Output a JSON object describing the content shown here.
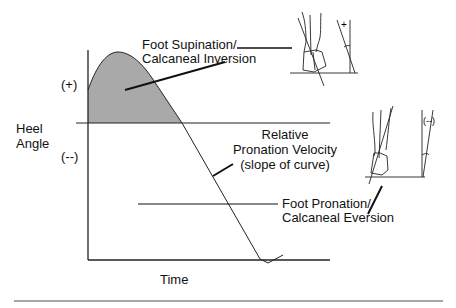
{
  "diagram": {
    "y_axis_label_line1": "Heel",
    "y_axis_label_line2": "Angle",
    "y_positive": "(+)",
    "y_negative": "(--)",
    "x_axis_label": "Time",
    "annotations": {
      "supination_line1": "Foot Supination/",
      "supination_line2": "Calcaneal Inversion",
      "velocity_line1": "Relative",
      "velocity_line2": "Pronation Velocity",
      "velocity_line3": "(slope of curve)",
      "pronation_line1": "Foot Pronation/",
      "pronation_line2": "Calcaneal Eversion"
    },
    "inset_top": {
      "angle_sign": "+"
    },
    "inset_bottom": {
      "angle_sign": "(--)"
    },
    "colors": {
      "shaded_area": "#a9a9a9",
      "lines": "#222222"
    }
  }
}
